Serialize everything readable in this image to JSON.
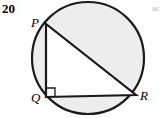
{
  "page": {
    "width": 167,
    "height": 118,
    "background": "#ffffff"
  },
  "problem": {
    "number": "20"
  },
  "figure": {
    "name": "circle-with-inscribed-right-triangle",
    "colors": {
      "circle_fill": "#ededed",
      "circle_stroke": "#1a1a1a",
      "triangle_fill": "#ffffff",
      "triangle_stroke": "#1a1a1a",
      "label_color": "#000000"
    },
    "circle": {
      "cx": 88,
      "cy": 58,
      "r": 56,
      "stroke_width": 2.2
    },
    "triangle": {
      "stroke_width": 2.2,
      "vertices": [
        {
          "label": "P",
          "x": 46,
          "y": 24
        },
        {
          "label": "Q",
          "x": 46,
          "y": 97
        },
        {
          "label": "R",
          "x": 136,
          "y": 95
        }
      ],
      "sides": [
        {
          "name": "PQ",
          "from": "P",
          "to": "Q"
        },
        {
          "name": "QR",
          "from": "Q",
          "to": "R"
        },
        {
          "name": "PR",
          "from": "P",
          "to": "R"
        }
      ]
    },
    "right_angle_marker": {
      "at_vertex": "Q",
      "size": 9,
      "stroke_width": 1.3
    },
    "labels": {
      "P": "P",
      "Q": "Q",
      "R": "R"
    }
  },
  "margin": {
    "cropped_line_1": "ac"
  }
}
